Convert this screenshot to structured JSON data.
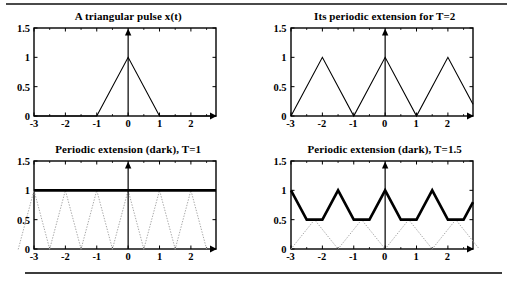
{
  "figure": {
    "rule_color": "#4a4a4a"
  },
  "axes": {
    "xticks": [
      "-3",
      "-2",
      "-1",
      "0",
      "1",
      "2"
    ],
    "xtick_values": [
      -3,
      -2,
      -1,
      0,
      1,
      2
    ],
    "yticks": [
      "0",
      "0.5",
      "1",
      "1.5"
    ],
    "ytick_values": [
      0,
      0.5,
      1,
      1.5
    ],
    "xlim": [
      -3,
      2.8
    ],
    "ylim": [
      0,
      1.5
    ]
  },
  "chart_data": [
    {
      "type": "line",
      "title": "A triangular pulse x(t)",
      "xlabel": "",
      "ylabel": "",
      "xlim": [
        -3,
        2.8
      ],
      "ylim": [
        0,
        1.5
      ],
      "grid": false,
      "legend": "none",
      "series": [
        {
          "name": "x(t)",
          "style": "thin",
          "color": "#000000",
          "x": [
            -3,
            -1,
            0,
            1,
            2.8
          ],
          "values": [
            0,
            0,
            1,
            0,
            0
          ]
        }
      ],
      "annotations": [
        "vertical arrow axis at x=0"
      ]
    },
    {
      "type": "line",
      "title": "Its periodic extension for T=2",
      "xlabel": "",
      "ylabel": "",
      "xlim": [
        -3,
        2.8
      ],
      "ylim": [
        0,
        1.5
      ],
      "grid": false,
      "legend": "none",
      "series": [
        {
          "name": "periodic extension T=2",
          "style": "thin",
          "color": "#000000",
          "x": [
            -3,
            -2,
            -1,
            0,
            1,
            2,
            2.8
          ],
          "values": [
            0,
            1,
            0,
            1,
            0,
            1,
            0.2
          ]
        }
      ],
      "annotations": [
        "vertical arrow axis at x=0"
      ]
    },
    {
      "type": "line",
      "title": "Periodic extension (dark), T=1",
      "xlabel": "",
      "ylabel": "",
      "xlim": [
        -3,
        2.8
      ],
      "ylim": [
        0,
        1.5
      ],
      "grid": false,
      "legend": "none",
      "series": [
        {
          "name": "sum (dark)",
          "style": "thick",
          "color": "#000000",
          "x": [
            -3,
            2.8
          ],
          "values": [
            1,
            1
          ]
        },
        {
          "name": "shifted copies (dotted)",
          "style": "dotted",
          "color": "#a8a8a8",
          "period": 1,
          "peak": 1,
          "peaks_at": [
            -3,
            -2,
            -1,
            0,
            1,
            2
          ],
          "zeros_at": [
            -2.5,
            -1.5,
            -0.5,
            0.5,
            1.5,
            2.5
          ]
        }
      ],
      "annotations": [
        "vertical arrow axis at x=0"
      ]
    },
    {
      "type": "line",
      "title": "Periodic extension (dark), T=1.5",
      "xlabel": "",
      "ylabel": "",
      "xlim": [
        -3,
        2.8
      ],
      "ylim": [
        0,
        1.5
      ],
      "grid": false,
      "legend": "none",
      "series": [
        {
          "name": "sum (dark)",
          "style": "thick",
          "color": "#000000",
          "period": 1.5,
          "peak": 1,
          "valley": 0.5,
          "x": [
            -3,
            -2.5,
            -2,
            -1.5,
            -1,
            -0.5,
            0,
            0.5,
            1,
            1.5,
            2,
            2.5,
            2.8
          ],
          "values": [
            1,
            0.5,
            0.5,
            1,
            0.5,
            0.5,
            1,
            0.5,
            0.5,
            1,
            0.5,
            0.5,
            0.8
          ]
        },
        {
          "name": "shifted copies (dotted)",
          "style": "dotted",
          "color": "#a8a8a8",
          "period": 1.5,
          "peak": 0.5,
          "peaks_at": [
            -2.25,
            -0.75,
            0.75,
            2.25
          ]
        }
      ],
      "annotations": [
        "vertical arrow axis at x=0"
      ]
    }
  ]
}
